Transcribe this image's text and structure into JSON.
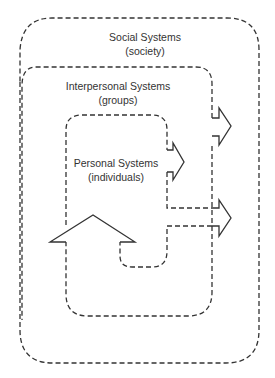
{
  "diagram": {
    "type": "nested systems",
    "line_color": "#333333",
    "levels": [
      {
        "title": "Social Systems",
        "subtitle": "(society)"
      },
      {
        "title": "Interpersonal Systems",
        "subtitle": "(groups)"
      },
      {
        "title": "Personal Systems",
        "subtitle": "(individuals)"
      }
    ]
  }
}
